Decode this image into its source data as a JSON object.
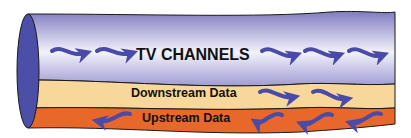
{
  "diagram": {
    "type": "cable-pipe",
    "bands": [
      {
        "id": "tv",
        "label": "TV CHANNELS",
        "direction": "right",
        "arrow_count_left": 2,
        "arrow_count_right": 3,
        "color_top": "#8a88c8",
        "color_mid": "#f2f0fa",
        "color_bottom": "#a9a6d6"
      },
      {
        "id": "downstream",
        "label": "Downstream Data",
        "direction": "right",
        "arrow_count_right": 2,
        "color": "#f8d79a"
      },
      {
        "id": "upstream",
        "label": "Upstream Data",
        "direction": "left",
        "arrow_count_left": 1,
        "arrow_count_right": 3,
        "color": "#e8672a"
      }
    ],
    "colors": {
      "arrow": "#4a4aa8",
      "outline": "#1a1a1a",
      "end_cap": "#4b4fa8"
    }
  }
}
